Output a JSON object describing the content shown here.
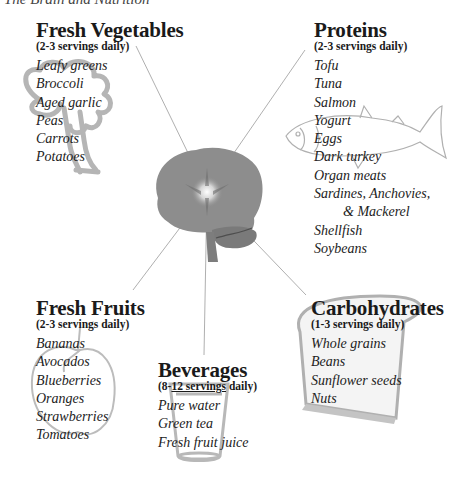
{
  "title": "The Brain and Nutrition",
  "center": {
    "label": "brain"
  },
  "groups": {
    "vegetables": {
      "title": "Fresh Vegetables",
      "servings": "(2-3 servings daily)",
      "items": [
        "Leafy greens",
        "Broccoli",
        "Aged garlic",
        "Peas",
        "Carrots",
        "Potatoes"
      ]
    },
    "proteins": {
      "title": "Proteins",
      "servings": "(2-3 servings daily)",
      "items": [
        "Tofu",
        "Tuna",
        "Salmon",
        "Yogurt",
        "Eggs",
        "Dark turkey",
        "Organ meats",
        "Sardines, Anchovies,",
        "& Mackerel",
        "Shellfish",
        "Soybeans"
      ]
    },
    "fruits": {
      "title": "Fresh Fruits",
      "servings": "(2-3 servings daily)",
      "items": [
        "Bananas",
        "Avocados",
        "Blueberries",
        "Oranges",
        "Strawberries",
        "Tomatoes"
      ]
    },
    "beverages": {
      "title": "Beverages",
      "servings_prefix": "(8-",
      "servings_underlined": "12 servings",
      "servings_suffix": " daily)",
      "items": [
        "Pure water",
        "Green tea",
        "Fresh fruit juice"
      ]
    },
    "carbohydrates": {
      "title": "Carbohydrates",
      "servings": "(1-3 servings daily)",
      "items": [
        "Whole grains",
        "Beans",
        "Sunflower seeds",
        "Nuts"
      ]
    }
  },
  "colors": {
    "brain": "#8a8a8a",
    "lines": "#9a9a9a",
    "sketch": "#b8b8b8",
    "text": "#1a1a1a"
  }
}
